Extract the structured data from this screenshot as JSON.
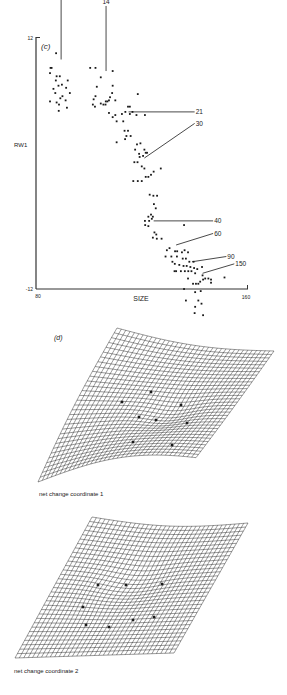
{
  "chart_data": [
    {
      "type": "scatter",
      "panel_label": "(c)",
      "title": "",
      "xlabel": "SIZE",
      "ylabel": "RW1",
      "xlim": [
        80,
        160
      ],
      "ylim": [
        -12,
        12
      ],
      "x_ticks": [
        "80",
        "160"
      ],
      "y_ticks": [
        "12",
        "-12"
      ],
      "grid": false,
      "legend": null,
      "annotations": [
        {
          "text": "7",
          "x": 89.5,
          "y": 9.9,
          "label_x": 89.5,
          "label_y": 15.8
        },
        {
          "text": "14",
          "x": 106.5,
          "y": 8.8,
          "label_x": 106.5,
          "label_y": 15.2
        },
        {
          "text": "21",
          "x": 115,
          "y": 4.9,
          "label_x": 140,
          "label_y": 4.9
        },
        {
          "text": "30",
          "x": 121,
          "y": 0.5,
          "label_x": 140,
          "label_y": 3.8
        },
        {
          "text": "40",
          "x": 124.5,
          "y": -5.5,
          "label_x": 147,
          "label_y": -5.5
        },
        {
          "text": "60",
          "x": 133,
          "y": -7.8,
          "label_x": 147,
          "label_y": -6.7
        },
        {
          "text": "90",
          "x": 139,
          "y": -9.4,
          "label_x": 152,
          "label_y": -8.9
        },
        {
          "text": "150",
          "x": 143,
          "y": -10.5,
          "label_x": 155,
          "label_y": -9.6
        }
      ],
      "points": [
        [
          85.5,
          9.1
        ],
        [
          85.9,
          9.1
        ],
        [
          85.3,
          8.6
        ],
        [
          87.5,
          7.9
        ],
        [
          88.5,
          7.4
        ],
        [
          86.6,
          7.1
        ],
        [
          87.3,
          6.7
        ],
        [
          89.2,
          6.2
        ],
        [
          90.0,
          6.4
        ],
        [
          92,
          7.9
        ],
        [
          91.4,
          7.2
        ],
        [
          92.8,
          6.7
        ],
        [
          87.6,
          10.5
        ],
        [
          87.8,
          8.3
        ],
        [
          89.0,
          8.3
        ],
        [
          89.8,
          7.5
        ],
        [
          91.2,
          6.0
        ],
        [
          85.3,
          5.9
        ],
        [
          87.8,
          5.8
        ],
        [
          88.6,
          5.0
        ],
        [
          91.7,
          5.3
        ],
        [
          88.7,
          5.6
        ],
        [
          100.5,
          9.1
        ],
        [
          102.5,
          9.1
        ],
        [
          104.5,
          8.2
        ],
        [
          103,
          7.3
        ],
        [
          102.5,
          6.4
        ],
        [
          101.8,
          6.1
        ],
        [
          101.5,
          5.6
        ],
        [
          104.5,
          5.7
        ],
        [
          105.5,
          5.6
        ],
        [
          106.3,
          5.6
        ],
        [
          107,
          5.9
        ],
        [
          108,
          6.3
        ],
        [
          109,
          7.4
        ],
        [
          108.8,
          6.7
        ],
        [
          109,
          8.8
        ],
        [
          110,
          6.0
        ],
        [
          107.6,
          6.0
        ],
        [
          102.3,
          5.4
        ],
        [
          106.4,
          5.9
        ],
        [
          107.6,
          4.8
        ],
        [
          109,
          4.4
        ],
        [
          110,
          4.6
        ],
        [
          110.5,
          4.0
        ],
        [
          112.5,
          4.7
        ],
        [
          113,
          4.0
        ],
        [
          113.8,
          4.9
        ],
        [
          114.8,
          5.4
        ],
        [
          115.5,
          5.4
        ],
        [
          116.5,
          4.9
        ],
        [
          115.5,
          4.7
        ],
        [
          118.0,
          4.6
        ],
        [
          121.2,
          4.6
        ],
        [
          118.5,
          6.6
        ],
        [
          113.5,
          3.1
        ],
        [
          114.8,
          3.1
        ],
        [
          110.5,
          2.0
        ],
        [
          114.2,
          2.6
        ],
        [
          113.7,
          2.3
        ],
        [
          115.8,
          2.6
        ],
        [
          118.2,
          1.8
        ],
        [
          119.5,
          1.9
        ],
        [
          117.5,
          1.3
        ],
        [
          119,
          0.9
        ],
        [
          120.5,
          0.7
        ],
        [
          121,
          1.3
        ],
        [
          119.2,
          0.6
        ],
        [
          121.5,
          1.0
        ],
        [
          122,
          1.0
        ],
        [
          117.2,
          0.1
        ],
        [
          118.4,
          0.1
        ],
        [
          120,
          -0.3
        ],
        [
          121,
          -0.5
        ],
        [
          127.2,
          -0.5
        ],
        [
          116.8,
          -1.7
        ],
        [
          118.5,
          -1.7
        ],
        [
          120.0,
          -1.7
        ],
        [
          121.5,
          -1.3
        ],
        [
          122.5,
          -1.3
        ],
        [
          123.5,
          -1.1
        ],
        [
          124.5,
          -0.8
        ],
        [
          123.0,
          -3.0
        ],
        [
          124.4,
          -3.1
        ],
        [
          125.8,
          -3.1
        ],
        [
          124.6,
          -3.9
        ],
        [
          125.3,
          -4.3
        ],
        [
          123.5,
          -4.9
        ],
        [
          124.2,
          -5.1
        ],
        [
          122.5,
          -5.1
        ],
        [
          122.8,
          -5.5
        ],
        [
          123.8,
          -5.3
        ],
        [
          121.2,
          -5.5
        ],
        [
          121.3,
          -5.9
        ],
        [
          122.5,
          -6.0
        ],
        [
          124.8,
          -6.6
        ],
        [
          125.5,
          -6.8
        ],
        [
          124.2,
          -7.1
        ],
        [
          125.7,
          -7.2
        ],
        [
          127.5,
          -7.2
        ],
        [
          136.0,
          -5.9
        ],
        [
          129.5,
          -8.3
        ],
        [
          130.5,
          -8.1
        ],
        [
          132.6,
          -8.4
        ],
        [
          133.4,
          -8.4
        ],
        [
          135.2,
          -8.5
        ],
        [
          136.2,
          -8.3
        ],
        [
          137.5,
          -8.5
        ],
        [
          129.0,
          -8.9
        ],
        [
          131.2,
          -8.9
        ],
        [
          133.3,
          -8.9
        ],
        [
          135.5,
          -9.1
        ],
        [
          136.7,
          -9.1
        ],
        [
          138,
          -9.4
        ],
        [
          139.6,
          -9.4
        ],
        [
          131.6,
          -9.4
        ],
        [
          132.5,
          -9.6
        ],
        [
          134.2,
          -9.7
        ],
        [
          135.8,
          -9.8
        ],
        [
          137.0,
          -9.8
        ],
        [
          138.4,
          -9.9
        ],
        [
          139.8,
          -10.0
        ],
        [
          141,
          -10.1
        ],
        [
          142.8,
          -9.9
        ],
        [
          132.4,
          -10.3
        ],
        [
          133.0,
          -10.3
        ],
        [
          134.8,
          -10.3
        ],
        [
          136.3,
          -10.3
        ],
        [
          137.6,
          -10.3
        ],
        [
          138.8,
          -10.3
        ],
        [
          140.2,
          -10.5
        ],
        [
          139.4,
          -11.5
        ],
        [
          140.5,
          -11.5
        ],
        [
          141.4,
          -11.5
        ],
        [
          142.1,
          -11.3
        ],
        [
          143.2,
          -11.1
        ],
        [
          144.0,
          -11.0
        ],
        [
          145.2,
          -11.0
        ],
        [
          146.2,
          -11.4
        ],
        [
          146.2,
          -11.1
        ],
        [
          151.3,
          -10.9
        ],
        [
          137.5,
          -11.0
        ],
        [
          143.0,
          -10.7
        ],
        [
          136.0,
          -12.0
        ],
        [
          140.2,
          -12.3
        ],
        [
          142.3,
          -12.2
        ],
        [
          141.4,
          -13.1
        ],
        [
          140.2,
          -13.7
        ],
        [
          136.7,
          -13.1
        ],
        [
          140.0,
          -14.3
        ],
        [
          142.6,
          -13.4
        ],
        [
          143.2,
          -14.5
        ]
      ]
    },
    {
      "type": "surface",
      "panel_label": "(d)",
      "caption": "net change coordinate 1",
      "grid_lines_u": 36,
      "grid_lines_v": 32,
      "landmarks": 7
    },
    {
      "type": "surface",
      "caption": "net change coordinate 2",
      "grid_lines_u": 36,
      "grid_lines_v": 32,
      "landmarks": 9
    }
  ],
  "panels": {
    "c": {
      "label": "(c)",
      "xlabel": "SIZE",
      "ylabel": "RW1",
      "xtick_min": "80",
      "xtick_max": "160",
      "ytick_max": "12",
      "ytick_min": "-12"
    },
    "d": {
      "label": "(d)",
      "caption1": "net change coordinate 1",
      "caption2": "net change coordinate 2"
    }
  },
  "colors": {
    "ink": "#1a1a1a",
    "paper": "#ffffff"
  }
}
